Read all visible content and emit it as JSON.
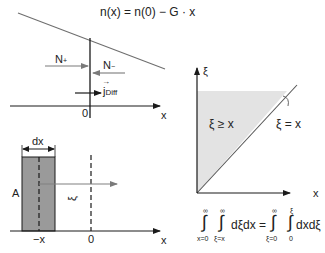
{
  "panel_top_left": {
    "formula": "n(x) = n(0) − G · x",
    "label_n_plus": "N",
    "label_n_plus_sub": "+",
    "label_n_minus": "N",
    "label_n_minus_sub": "−",
    "label_j": "j",
    "label_j_vec": "→",
    "label_j_sub": "Diff",
    "origin_label": "0",
    "axis_label": "x",
    "colors": {
      "line": "#6e6e6e",
      "arrow_gray": "#7a7a7a",
      "axis": "#1a1a1a"
    }
  },
  "panel_bottom_left": {
    "width_label": "dx",
    "area_label": "A",
    "xi_label": "ξ",
    "minus_x_label": "−x",
    "origin_label": "0",
    "axis_label": "x",
    "colors": {
      "rect_fill": "#9a9a9a",
      "rect_stroke": "#1a1a1a",
      "arrow": "#808080"
    }
  },
  "panel_right": {
    "y_axis_label": "ξ",
    "x_axis_label": "x",
    "region_label": "ξ ≥ x",
    "line_label": "ξ = x",
    "colors": {
      "region_fill": "#e3e3e3",
      "diagonal": "#555555"
    }
  },
  "equation": {
    "lhs_outer_upper": "∞",
    "lhs_outer_lower": "x=0",
    "lhs_inner_upper": "∞",
    "lhs_inner_lower": "ξ=x",
    "lhs_integrand": "dξdx =",
    "rhs_outer_upper": "∞",
    "rhs_outer_lower": "ξ=0",
    "rhs_inner_upper": "ξ",
    "rhs_inner_lower": "0",
    "rhs_integrand": "dxdξ",
    "integral_sign": "∫"
  }
}
